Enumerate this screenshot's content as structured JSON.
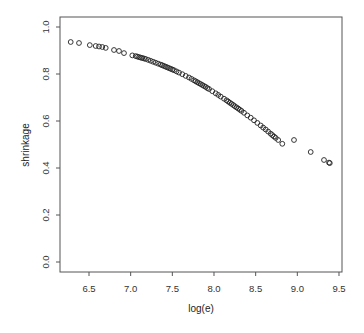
{
  "chart_data": {
    "type": "scatter",
    "title": "",
    "xlabel": "log(e)",
    "ylabel": "shrinkage",
    "xlim": [
      6.2,
      9.55
    ],
    "ylim": [
      -0.04,
      1.04
    ],
    "xticks": [
      6.5,
      7.0,
      7.5,
      8.0,
      8.5,
      9.0,
      9.5
    ],
    "xtick_labels": [
      "6.5",
      "7.0",
      "7.5",
      "8.0",
      "8.5",
      "9.0",
      "9.5"
    ],
    "yticks": [
      0.0,
      0.2,
      0.4,
      0.6,
      0.8,
      1.0
    ],
    "ytick_labels": [
      "0.0",
      "0.2",
      "0.4",
      "0.6",
      "0.8",
      "1.0"
    ],
    "grid": false,
    "legend": null,
    "marker": "open-circle",
    "series": [
      {
        "name": "shrinkage",
        "x": [
          6.28,
          6.38,
          6.51,
          6.58,
          6.62,
          6.66,
          6.7,
          6.8,
          6.86,
          6.92,
          7.02,
          7.06,
          7.08,
          7.1,
          7.12,
          7.14,
          7.16,
          7.18,
          7.21,
          7.24,
          7.27,
          7.3,
          7.33,
          7.36,
          7.38,
          7.4,
          7.42,
          7.44,
          7.46,
          7.48,
          7.5,
          7.52,
          7.55,
          7.58,
          7.62,
          7.66,
          7.7,
          7.73,
          7.76,
          7.78,
          7.8,
          7.82,
          7.84,
          7.86,
          7.88,
          7.9,
          7.92,
          7.94,
          7.98,
          8.02,
          8.05,
          8.08,
          8.12,
          8.15,
          8.17,
          8.19,
          8.21,
          8.23,
          8.25,
          8.27,
          8.29,
          8.31,
          8.33,
          8.36,
          8.4,
          8.44,
          8.48,
          8.52,
          8.56,
          8.59,
          8.62,
          8.65,
          8.68,
          8.7,
          8.72,
          8.74,
          8.77,
          8.82,
          8.96,
          9.16,
          9.32,
          9.38,
          9.39
        ],
        "y": [
          0.936,
          0.932,
          0.923,
          0.919,
          0.917,
          0.915,
          0.911,
          0.902,
          0.898,
          0.889,
          0.879,
          0.876,
          0.874,
          0.872,
          0.87,
          0.868,
          0.866,
          0.864,
          0.86,
          0.856,
          0.852,
          0.848,
          0.844,
          0.84,
          0.837,
          0.834,
          0.831,
          0.828,
          0.825,
          0.822,
          0.819,
          0.816,
          0.811,
          0.806,
          0.799,
          0.792,
          0.785,
          0.779,
          0.773,
          0.769,
          0.765,
          0.761,
          0.757,
          0.753,
          0.749,
          0.745,
          0.74,
          0.736,
          0.727,
          0.718,
          0.711,
          0.704,
          0.695,
          0.688,
          0.683,
          0.678,
          0.673,
          0.668,
          0.663,
          0.658,
          0.653,
          0.648,
          0.643,
          0.635,
          0.624,
          0.614,
          0.603,
          0.592,
          0.581,
          0.572,
          0.564,
          0.555,
          0.546,
          0.54,
          0.534,
          0.528,
          0.519,
          0.503,
          0.519,
          0.468,
          0.434,
          0.423,
          0.421
        ]
      }
    ]
  }
}
